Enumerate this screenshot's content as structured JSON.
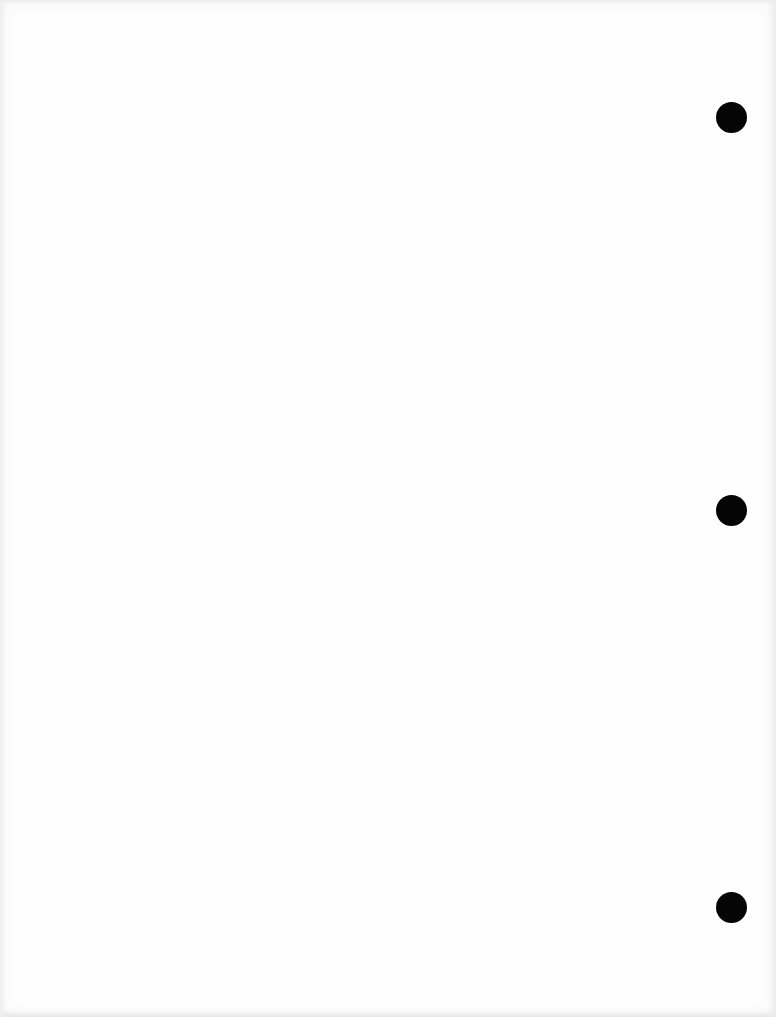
{
  "document": {
    "type": "blank scanned page",
    "background_color": "#fefefe",
    "text": ""
  },
  "punch_holes": [
    {
      "id": "top",
      "cx": 731,
      "cy": 117,
      "diameter": 31,
      "color": "#050505"
    },
    {
      "id": "middle",
      "cx": 731,
      "cy": 510,
      "diameter": 31,
      "color": "#050505"
    },
    {
      "id": "bottom",
      "cx": 731,
      "cy": 907,
      "diameter": 31,
      "color": "#050505"
    }
  ]
}
